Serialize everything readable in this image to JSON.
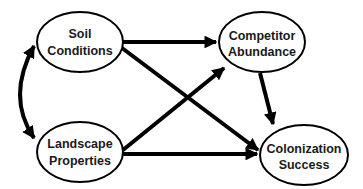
{
  "diagram": {
    "type": "path-diagram",
    "nodes": [
      {
        "id": "soil",
        "line1": "Soil",
        "line2": "Conditions"
      },
      {
        "id": "competitor",
        "line1": "Competitor",
        "line2": "Abundance"
      },
      {
        "id": "landscape",
        "line1": "Landscape",
        "line2": "Properties"
      },
      {
        "id": "colonization",
        "line1": "Colonization",
        "line2": "Success"
      }
    ],
    "edges": [
      {
        "from": "soil",
        "to": "landscape",
        "type": "bidirectional-curved"
      },
      {
        "from": "soil",
        "to": "competitor",
        "type": "directed"
      },
      {
        "from": "soil",
        "to": "colonization",
        "type": "directed"
      },
      {
        "from": "landscape",
        "to": "competitor",
        "type": "directed"
      },
      {
        "from": "landscape",
        "to": "colonization",
        "type": "directed"
      },
      {
        "from": "competitor",
        "to": "colonization",
        "type": "directed"
      }
    ],
    "colors": {
      "stroke": "#000000",
      "fill": "#ffffff",
      "text": "#1a1a1a"
    }
  }
}
